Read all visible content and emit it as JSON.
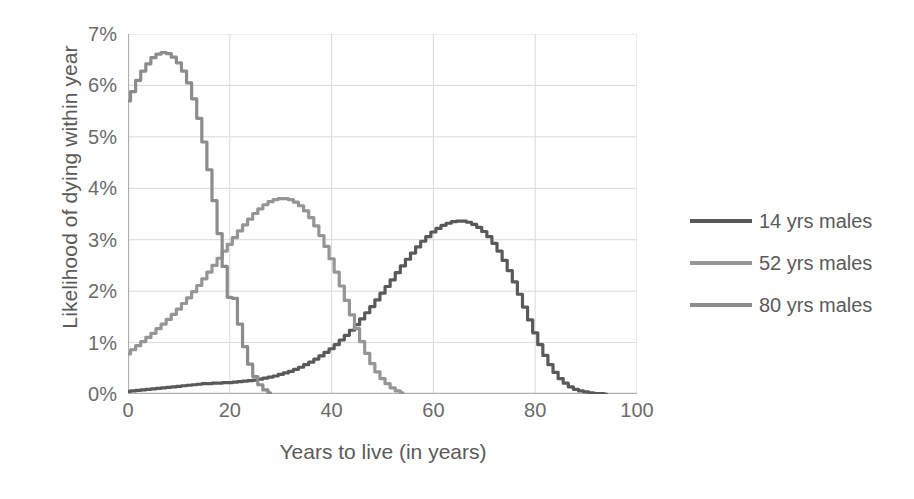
{
  "chart_data": {
    "type": "line",
    "title": "",
    "xlabel": "Years to live (in years)",
    "ylabel": "Likelihood of dying within year",
    "xlim": [
      0,
      100
    ],
    "ylim": [
      0,
      7
    ],
    "xticks": [
      0,
      20,
      40,
      60,
      80,
      100
    ],
    "xtick_labels": [
      "0",
      "20",
      "40",
      "60",
      "80",
      "100"
    ],
    "yticks": [
      0,
      1,
      2,
      3,
      4,
      5,
      6,
      7
    ],
    "ytick_labels": [
      "0%",
      "1%",
      "2%",
      "3%",
      "4%",
      "5%",
      "6%",
      "7%"
    ],
    "grid": true,
    "grid_axis": "both",
    "legend_position": "right",
    "y_unit": "percent",
    "series": [
      {
        "name": "14 yrs males",
        "color": "#595959",
        "x": [
          0,
          1,
          2,
          3,
          4,
          5,
          6,
          7,
          8,
          9,
          10,
          11,
          12,
          13,
          14,
          15,
          16,
          17,
          18,
          19,
          20,
          21,
          22,
          23,
          24,
          25,
          26,
          27,
          28,
          29,
          30,
          31,
          32,
          33,
          34,
          35,
          36,
          37,
          38,
          39,
          40,
          41,
          42,
          43,
          44,
          45,
          46,
          47,
          48,
          49,
          50,
          51,
          52,
          53,
          54,
          55,
          56,
          57,
          58,
          59,
          60,
          61,
          62,
          63,
          64,
          65,
          66,
          67,
          68,
          69,
          70,
          71,
          72,
          73,
          74,
          75,
          76,
          77,
          78,
          79,
          80,
          81,
          82,
          83,
          84,
          85,
          86,
          87,
          88,
          89,
          90,
          91,
          92,
          93,
          94
        ],
        "values": [
          0.05,
          0.06,
          0.07,
          0.08,
          0.09,
          0.1,
          0.11,
          0.12,
          0.13,
          0.14,
          0.15,
          0.16,
          0.17,
          0.18,
          0.19,
          0.2,
          0.2,
          0.21,
          0.21,
          0.22,
          0.22,
          0.23,
          0.24,
          0.25,
          0.26,
          0.27,
          0.29,
          0.31,
          0.33,
          0.35,
          0.38,
          0.41,
          0.44,
          0.48,
          0.52,
          0.57,
          0.62,
          0.68,
          0.74,
          0.81,
          0.88,
          0.96,
          1.05,
          1.14,
          1.24,
          1.35,
          1.46,
          1.58,
          1.7,
          1.83,
          1.96,
          2.09,
          2.22,
          2.36,
          2.49,
          2.62,
          2.74,
          2.86,
          2.97,
          3.06,
          3.15,
          3.22,
          3.28,
          3.32,
          3.35,
          3.36,
          3.36,
          3.34,
          3.3,
          3.24,
          3.16,
          3.06,
          2.93,
          2.78,
          2.6,
          2.4,
          2.18,
          1.94,
          1.69,
          1.44,
          1.19,
          0.96,
          0.75,
          0.57,
          0.42,
          0.3,
          0.21,
          0.14,
          0.09,
          0.06,
          0.04,
          0.02,
          0.01,
          0.01,
          0.0
        ]
      },
      {
        "name": "52 yrs males",
        "color": "#959595",
        "x": [
          0,
          1,
          2,
          3,
          4,
          5,
          6,
          7,
          8,
          9,
          10,
          11,
          12,
          13,
          14,
          15,
          16,
          17,
          18,
          19,
          20,
          21,
          22,
          23,
          24,
          25,
          26,
          27,
          28,
          29,
          30,
          31,
          32,
          33,
          34,
          35,
          36,
          37,
          38,
          39,
          40,
          41,
          42,
          43,
          44,
          45,
          46,
          47,
          48,
          49,
          50,
          51,
          52,
          53,
          54
        ],
        "values": [
          0.78,
          0.86,
          0.94,
          1.02,
          1.1,
          1.18,
          1.27,
          1.36,
          1.45,
          1.55,
          1.65,
          1.76,
          1.87,
          1.99,
          2.11,
          2.24,
          2.37,
          2.5,
          2.64,
          2.78,
          2.91,
          3.04,
          3.17,
          3.29,
          3.4,
          3.51,
          3.6,
          3.68,
          3.74,
          3.78,
          3.8,
          3.8,
          3.78,
          3.73,
          3.66,
          3.56,
          3.43,
          3.27,
          3.08,
          2.87,
          2.63,
          2.37,
          2.1,
          1.82,
          1.54,
          1.27,
          1.02,
          0.79,
          0.59,
          0.43,
          0.3,
          0.2,
          0.12,
          0.06,
          0.02
        ]
      },
      {
        "name": "80 yrs males",
        "color": "#8c8c8c",
        "x": [
          0,
          1,
          2,
          3,
          4,
          5,
          6,
          7,
          8,
          9,
          10,
          11,
          12,
          13,
          14,
          15,
          16,
          17,
          18,
          19,
          20,
          21,
          22,
          23,
          24,
          25,
          26,
          27,
          28
        ],
        "values": [
          5.7,
          5.88,
          6.1,
          6.28,
          6.42,
          6.54,
          6.61,
          6.64,
          6.62,
          6.55,
          6.44,
          6.28,
          6.05,
          5.74,
          5.36,
          4.9,
          4.36,
          3.76,
          3.12,
          2.48,
          1.88,
          1.86,
          1.36,
          0.92,
          0.58,
          0.34,
          0.18,
          0.08,
          0.02
        ]
      }
    ]
  },
  "legend": {
    "items": [
      {
        "label": "14 yrs males",
        "color": "#595959"
      },
      {
        "label": "52 yrs males",
        "color": "#959595"
      },
      {
        "label": "80 yrs males",
        "color": "#8c8c8c"
      }
    ]
  },
  "axes": {
    "x_title": "Years to live (in years)",
    "y_title": "Likelihood of dying within year"
  }
}
